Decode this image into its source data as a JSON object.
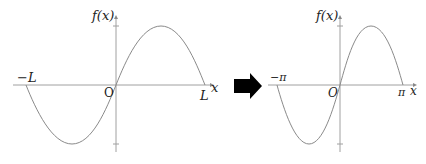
{
  "left_plot": {
    "y_axis_label": "f(x)",
    "x_axis_label": "x",
    "origin_label": "O",
    "neg_label": "−L",
    "pos_label": "L",
    "curve": "sin(pi*x/L) over [-L, L]"
  },
  "transform_arrow": {
    "icon": "right-arrow-icon",
    "color": "#000000"
  },
  "right_plot": {
    "y_axis_label": "f(x)",
    "x_axis_label": "x",
    "origin_label": "O",
    "neg_label": "−π",
    "pos_label": "π",
    "curve": "sin(x) over [-π, π]"
  },
  "colors": {
    "axis": "#9a9a9a",
    "curve": "#8a8a8a",
    "text": "#222222"
  }
}
